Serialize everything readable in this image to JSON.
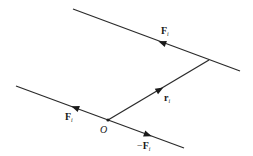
{
  "diagram": {
    "type": "force couple / line of action diagram",
    "lines": [
      {
        "id": "upper-line-of-action",
        "from": [
          73,
          9
        ],
        "to": [
          240,
          71
        ]
      },
      {
        "id": "lower-line-of-action",
        "from": [
          16,
          86
        ],
        "to": [
          184,
          148
        ]
      },
      {
        "id": "position-vector",
        "from": [
          108,
          120
        ],
        "to": [
          209,
          60
        ]
      }
    ],
    "labels": {
      "upper_force": {
        "main": "F",
        "sub": "i"
      },
      "lower_force": {
        "main": "F",
        "sub": "i"
      },
      "negative_force": {
        "prefix": "−",
        "main": "F",
        "sub": "i"
      },
      "position_vector": {
        "main": "r",
        "sub": "i"
      },
      "origin": "O"
    },
    "colors": {
      "line": "#2b2b2b",
      "text": "#1a1a1a",
      "background": "#ffffff"
    }
  }
}
